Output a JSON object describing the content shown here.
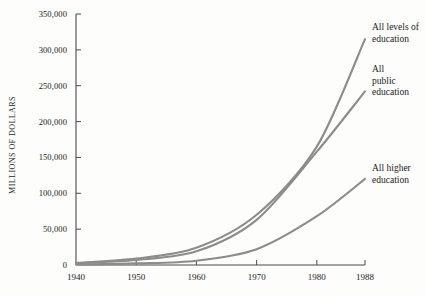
{
  "chart_data": {
    "type": "line",
    "title": "",
    "xlabel": "",
    "ylabel": "MILLIONS OF DOLLARS",
    "x": [
      1940,
      1950,
      1960,
      1970,
      1980,
      1988
    ],
    "xlim": [
      1940,
      1988
    ],
    "ylim": [
      0,
      350000
    ],
    "grid": false,
    "legend_position": "right-inline",
    "ytick_labels": [
      "0",
      "50,000",
      "100,000",
      "150,000",
      "200,000",
      "250,000",
      "300,000",
      "350,000"
    ],
    "ytick_values": [
      0,
      50000,
      100000,
      150000,
      200000,
      250000,
      300000,
      350000
    ],
    "xtick_labels": [
      "1940",
      "1950",
      "1960",
      "1970",
      "1980",
      "1988"
    ],
    "series": [
      {
        "name": "All levels of education",
        "label": "All levels of\neducation",
        "color": "#8c8c8c",
        "values": [
          3000,
          9000,
          24000,
          70000,
          165000,
          315000
        ]
      },
      {
        "name": "All public education",
        "label": "All\npublic\neducation",
        "color": "#8c8c8c",
        "values": [
          2400,
          7000,
          19000,
          63000,
          158000,
          242000
        ]
      },
      {
        "name": "All higher education",
        "label": "All higher\neducation",
        "color": "#8c8c8c",
        "values": [
          700,
          2200,
          6000,
          22000,
          68000,
          120000
        ]
      }
    ]
  },
  "axis": {
    "line_color": "#4a4a4a",
    "tick_color": "#4a4a4a"
  }
}
